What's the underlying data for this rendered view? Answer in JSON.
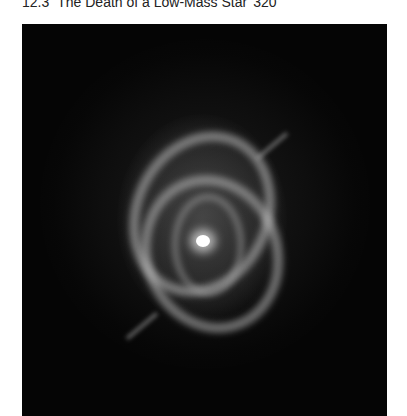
{
  "header": {
    "section_number": "12.3",
    "section_title": "The Death of a Low-Mass Star",
    "page_number": "320"
  },
  "figure": {
    "colors": {
      "background": "#050505",
      "nebula": "#c8c8c8",
      "core": "#ffffff"
    }
  }
}
